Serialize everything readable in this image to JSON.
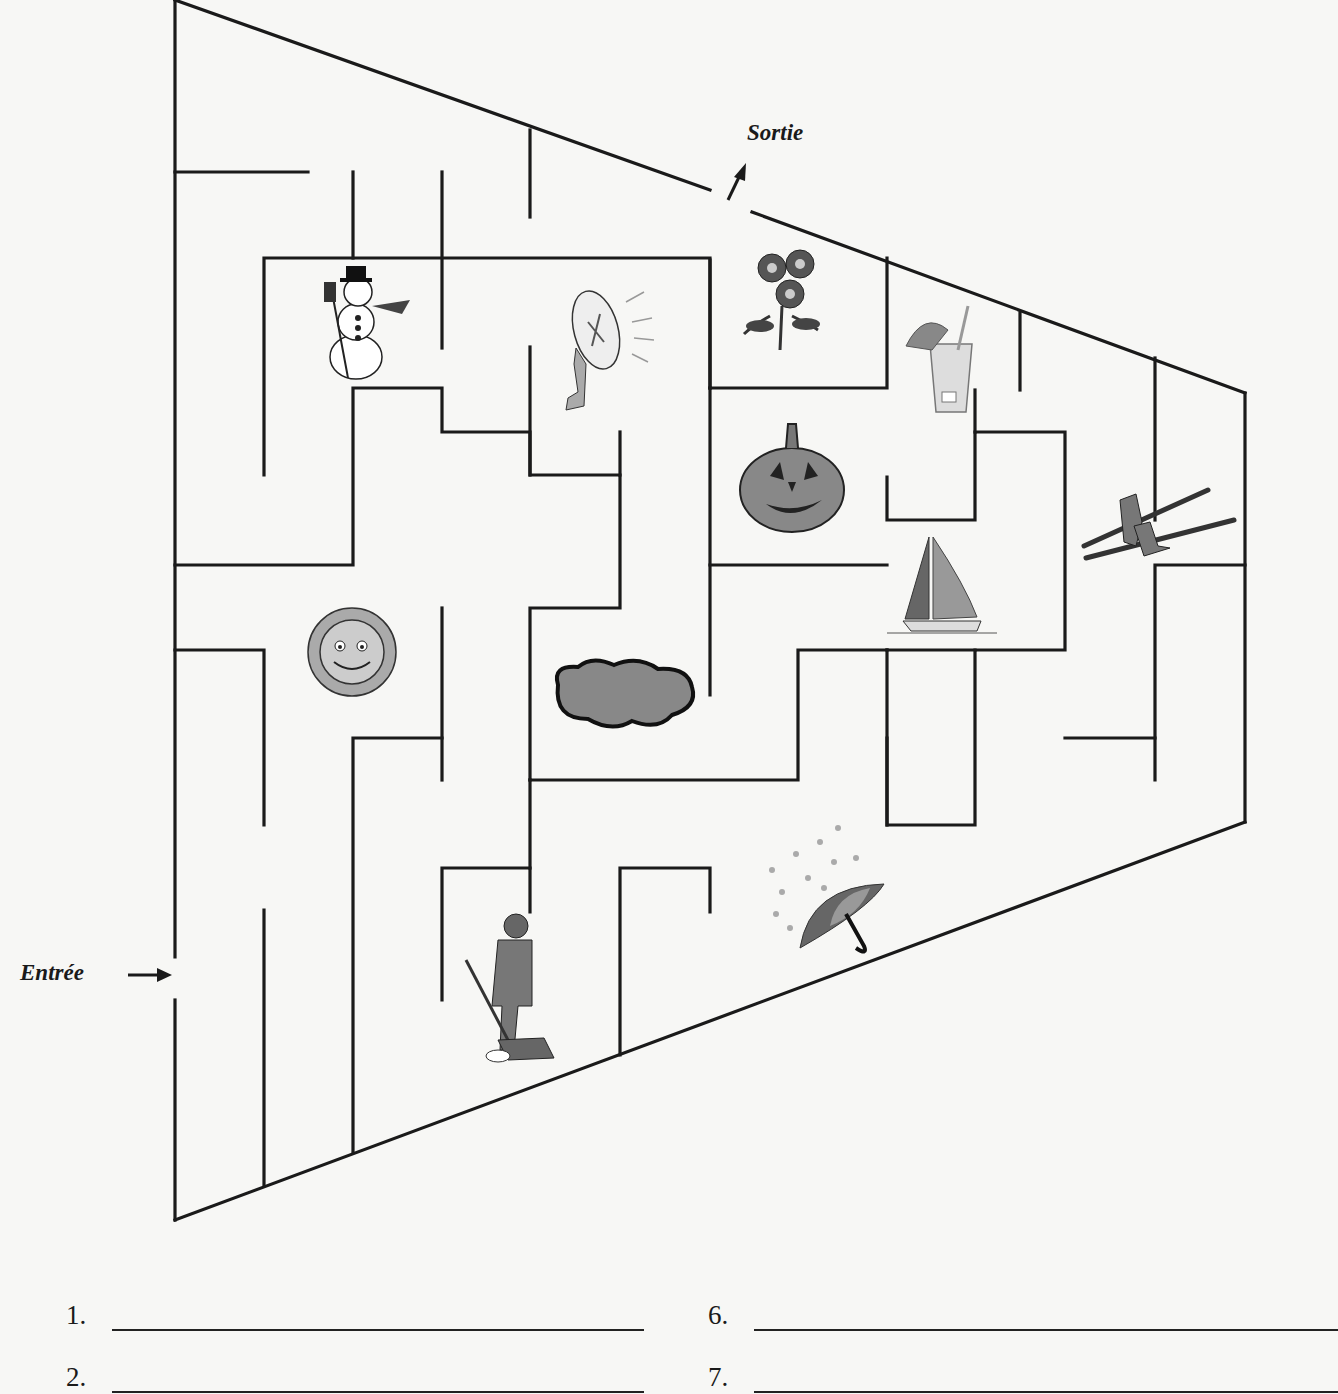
{
  "labels": {
    "exit": "Sortie",
    "entrance": "Entrée"
  },
  "pictures": [
    {
      "name": "snowman",
      "x": 318,
      "y": 262
    },
    {
      "name": "electric-fan",
      "x": 548,
      "y": 272
    },
    {
      "name": "flowers",
      "x": 742,
      "y": 246
    },
    {
      "name": "tropical-drink",
      "x": 902,
      "y": 306
    },
    {
      "name": "jack-o-lantern",
      "x": 740,
      "y": 420
    },
    {
      "name": "skis",
      "x": 1080,
      "y": 486
    },
    {
      "name": "sailboat",
      "x": 885,
      "y": 535
    },
    {
      "name": "sun",
      "x": 288,
      "y": 590
    },
    {
      "name": "cloud",
      "x": 548,
      "y": 655
    },
    {
      "name": "umbrella-rain",
      "x": 760,
      "y": 818
    },
    {
      "name": "person-shoveling-snow",
      "x": 458,
      "y": 910
    }
  ],
  "answers": [
    {
      "number": "1.",
      "value": ""
    },
    {
      "number": "2.",
      "value": ""
    },
    {
      "number": "6.",
      "value": ""
    },
    {
      "number": "7.",
      "value": ""
    }
  ]
}
